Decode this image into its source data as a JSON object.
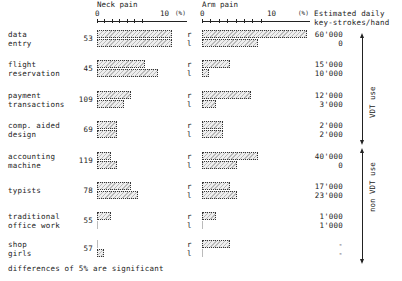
{
  "chart_data": {
    "type": "bar",
    "title": "",
    "panels": [
      {
        "name": "Neck pain",
        "unit": "(%)",
        "ticks": [
          "0",
          "10"
        ],
        "xlim": [
          0,
          11
        ]
      },
      {
        "name": "Arm pain",
        "unit": "(%)",
        "ticks": [
          "0",
          "10"
        ],
        "xlim": [
          0,
          15
        ]
      }
    ],
    "right_header": "Estimated daily key-strokes/hand",
    "side_labels": [
      "r",
      "l"
    ],
    "categories": [
      {
        "label": [
          "data",
          "entry"
        ],
        "n": "53",
        "neck": {
          "r": 11,
          "l": 11
        },
        "arm": {
          "r": 15,
          "l": 8
        },
        "keystrokes": {
          "r": "60'000",
          "l": "0"
        }
      },
      {
        "label": [
          "flight",
          "reservation"
        ],
        "n": "45",
        "neck": {
          "r": 7,
          "l": 9
        },
        "arm": {
          "r": 4,
          "l": 1
        },
        "keystrokes": {
          "r": "15'000",
          "l": "10'000"
        }
      },
      {
        "label": [
          "payment",
          "transactions"
        ],
        "n": "109",
        "neck": {
          "r": 5,
          "l": 4
        },
        "arm": {
          "r": 7,
          "l": 2
        },
        "keystrokes": {
          "r": "12'000",
          "l": "3'000"
        }
      },
      {
        "label": [
          "comp. aided",
          "design"
        ],
        "n": "69",
        "neck": {
          "r": 3,
          "l": 3
        },
        "arm": {
          "r": 3,
          "l": 3
        },
        "keystrokes": {
          "r": "2'000",
          "l": "2'000"
        }
      },
      {
        "label": [
          "accounting",
          "machine"
        ],
        "n": "119",
        "neck": {
          "r": 2,
          "l": 3
        },
        "arm": {
          "r": 8,
          "l": 5
        },
        "keystrokes": {
          "r": "40'000",
          "l": "0"
        }
      },
      {
        "label": [
          "typists",
          ""
        ],
        "n": "78",
        "neck": {
          "r": 5,
          "l": 6
        },
        "arm": {
          "r": 4,
          "l": 5
        },
        "keystrokes": {
          "r": "17'000",
          "l": "23'000"
        }
      },
      {
        "label": [
          "traditional",
          "office work"
        ],
        "n": "55",
        "neck": {
          "r": 2,
          "l": 0
        },
        "arm": {
          "r": 2,
          "l": 0
        },
        "keystrokes": {
          "r": "1'000",
          "l": "1'000"
        }
      },
      {
        "label": [
          "shop",
          "girls"
        ],
        "n": "57",
        "neck": {
          "r": 0,
          "l": 1
        },
        "arm": {
          "r": 4,
          "l": 0
        },
        "keystrokes": {
          "r": "-",
          "l": "-"
        }
      }
    ],
    "groups": [
      {
        "label": "VDT use",
        "rows": [
          0,
          3
        ]
      },
      {
        "label": "non VDT use",
        "rows": [
          4,
          7
        ]
      }
    ],
    "footnote": "differences of 5% are significant"
  },
  "labels": {
    "neck_title": "Neck pain",
    "arm_title": "Arm pain",
    "unit": "(%)",
    "tick0": "0",
    "tick10": "10",
    "right_header_1": "Estimated daily",
    "right_header_2": "key-strokes/hand",
    "group_vdt": "VDT use",
    "group_non_vdt": "non VDT use",
    "footnote": "differences of 5% are significant"
  }
}
